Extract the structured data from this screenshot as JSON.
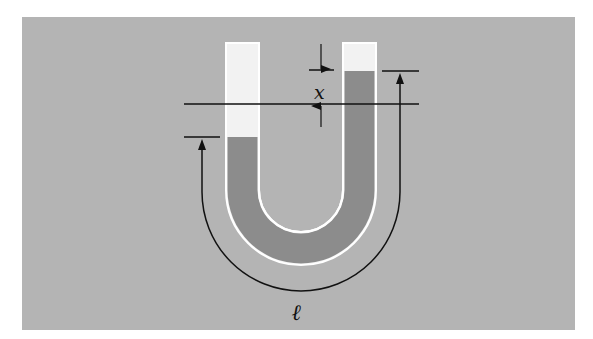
{
  "figure": {
    "labels": {
      "height_difference": "x",
      "column_length": "ℓ"
    },
    "colors": {
      "background": "#b4b4b4",
      "liquid": "#8c8c8c",
      "empty_tube": "#f2f2f2",
      "tube_outline": "#ffffff",
      "lines": "#111111"
    }
  }
}
